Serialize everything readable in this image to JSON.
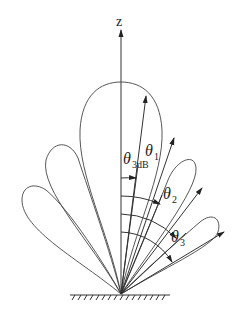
{
  "diagram": {
    "type": "antenna radiation pattern (multi-lobe, above ground plane)",
    "axis": {
      "label": "z"
    },
    "labels": [
      {
        "id": "theta_3dB",
        "symbol": "θ",
        "subscript": "3dB"
      },
      {
        "id": "theta_1",
        "symbol": "θ",
        "subscript": "1"
      },
      {
        "id": "theta_2",
        "symbol": "θ",
        "subscript": "2"
      },
      {
        "id": "theta_3",
        "symbol": "θ",
        "subscript": "3"
      }
    ],
    "lobes": [
      "main-lobe",
      "side-lobe-left-1",
      "side-lobe-left-2",
      "side-lobe-right-1",
      "side-lobe-right-2"
    ],
    "ground": "hatched ground plane"
  }
}
